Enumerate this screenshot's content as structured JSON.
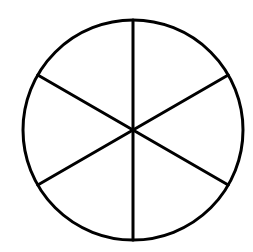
{
  "diagram": {
    "type": "circle-divided-into-equal-sectors",
    "sectors": 6,
    "center": [
      133,
      130
    ],
    "radius": 110,
    "stroke_color": "#000000",
    "fill_color": "#ffffff",
    "stroke_width": 3,
    "divider_angles_deg": [
      90,
      30,
      -30,
      -90,
      -150,
      150
    ]
  }
}
